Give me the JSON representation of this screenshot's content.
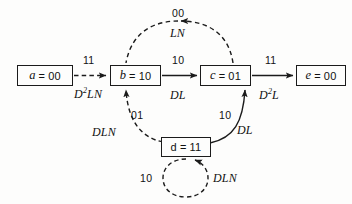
{
  "diagram": {
    "background_color": "#fdfdfc",
    "stroke_color": "#1b1b1b",
    "states": [
      {
        "id": "a",
        "name": "a",
        "equals": "=",
        "value": "00",
        "x": 17,
        "y": 65,
        "w": 56,
        "h": 21
      },
      {
        "id": "b",
        "name": "b",
        "equals": "=",
        "value": "10",
        "x": 110,
        "y": 65,
        "w": 51,
        "h": 21
      },
      {
        "id": "c",
        "name": "c",
        "equals": "=",
        "value": "01",
        "x": 200,
        "y": 65,
        "w": 51,
        "h": 21
      },
      {
        "id": "e",
        "name": "e",
        "equals": "=",
        "value": "00",
        "x": 296,
        "y": 65,
        "w": 50,
        "h": 21
      },
      {
        "id": "d",
        "name": "d",
        "equals": "=",
        "value": "11",
        "x": 161,
        "y": 137,
        "w": 50,
        "h": 20
      }
    ],
    "transitions": [
      {
        "id": "a-to-b",
        "from": "a",
        "to": "b",
        "input": "11",
        "output": "D2LN",
        "output_base": "D",
        "output_sup": "2",
        "output_rest": "LN",
        "style": "dashed"
      },
      {
        "id": "b-to-c",
        "from": "b",
        "to": "c",
        "input": "10",
        "output": "DL",
        "style": "solid"
      },
      {
        "id": "c-to-e",
        "from": "c",
        "to": "e",
        "input": "11",
        "output": "D2L",
        "output_base": "D",
        "output_sup": "2",
        "output_rest": "L",
        "style": "solid"
      },
      {
        "id": "c-to-b",
        "from": "c",
        "to": "b",
        "input": "00",
        "output": "LN",
        "style": "dashed"
      },
      {
        "id": "b-to-d",
        "from": "d",
        "to": "b",
        "input": "01",
        "output": "DLN",
        "style": "dashed"
      },
      {
        "id": "d-to-c",
        "from": "d",
        "to": "c",
        "input": "10",
        "output": "DL",
        "style": "solid"
      },
      {
        "id": "d-self",
        "from": "d",
        "to": "d",
        "input": "10",
        "output": "DLN",
        "style": "dashed"
      }
    ]
  }
}
